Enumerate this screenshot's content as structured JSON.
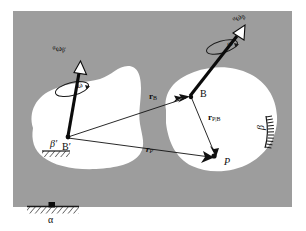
{
  "figure": {
    "type": "kinematics-diagram",
    "panel_color": "#9d9d9d",
    "body_color": "#ffffff",
    "ink_color": "#0b0b0b"
  },
  "labels": {
    "omega_left": {
      "sup": "α",
      "omega": "ω",
      "sub": "β′"
    },
    "omega_right": {
      "sup": "α",
      "omega": "ω",
      "sub": "β"
    },
    "omega_curl_left": "ω",
    "omega_curl_right": "ω",
    "point_b_prime": "B′",
    "point_b": "B",
    "point_p": "P",
    "vector_rb": {
      "symbol": "r",
      "sub": "B"
    },
    "vector_rp": {
      "symbol": "r",
      "sub": "P"
    },
    "vector_rp_b": {
      "symbol": "r",
      "sub": "P|B"
    },
    "body_beta_prime": "β′",
    "body_beta": "β",
    "frame_alpha": "α"
  },
  "points": {
    "b_prime": {
      "x": 68,
      "y": 137
    },
    "b": {
      "x": 192,
      "y": 97
    },
    "p": {
      "x": 217,
      "y": 157
    },
    "ground_pivot": {
      "x": 52,
      "y": 206
    }
  },
  "vectors": [
    {
      "name": "r_B",
      "from": "b_prime",
      "to": "b",
      "label": "r_B"
    },
    {
      "name": "r_P",
      "from": "b_prime",
      "to": "p",
      "label": "r_P"
    },
    {
      "name": "r_P|B",
      "from": "b",
      "to": "p",
      "label": "r_P|B"
    }
  ]
}
